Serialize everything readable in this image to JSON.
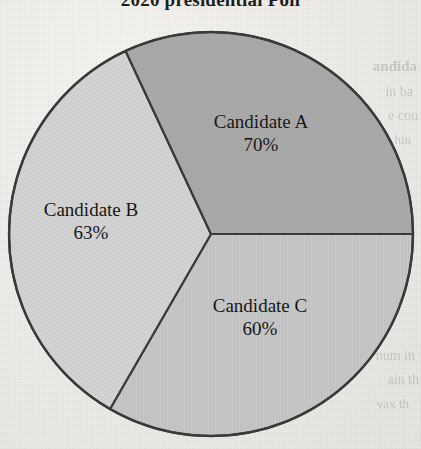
{
  "chart_data": {
    "type": "pie",
    "title": "2020 presidential Poll",
    "categories": [
      "Candidate A",
      "Candidate B",
      "Candidate C"
    ],
    "values": [
      70,
      63,
      60
    ],
    "value_unit": "%",
    "value_labels": [
      "70%",
      "63%",
      "60%"
    ],
    "slice_colors": [
      "#a9a9a9",
      "#d2d2d2",
      "#c6c6c6"
    ],
    "slice_angles_deg": [
      115,
      125,
      120
    ],
    "legend": "none",
    "grid": false,
    "xlabel": "",
    "ylabel": "",
    "note": "Percentages sum to 193%, exceeding 100%"
  },
  "chart": {
    "title": "2020 presidential Poll",
    "geometry": {
      "center_x": 211,
      "center_y": 234,
      "radius": 202,
      "outline_color": "#3a3a3a",
      "divider_color": "#3a3a3a"
    },
    "slices": [
      {
        "id": "a",
        "name": "Candidate A",
        "value_label": "70%",
        "value": 70,
        "color": "#a9a9a9",
        "start_deg": -115,
        "end_deg": 0
      },
      {
        "id": "b",
        "name": "Candidate B",
        "value_label": "63%",
        "value": 63,
        "color": "#d2d2d2",
        "start_deg": 120,
        "end_deg": 245
      },
      {
        "id": "c",
        "name": "Candidate C",
        "value_label": "60%",
        "value": 60,
        "color": "#c6c6c6",
        "start_deg": 0,
        "end_deg": 120
      }
    ]
  },
  "background": {
    "paper_color": "#f1f0ed",
    "showthrough": [
      "andida",
      "in ba",
      "e cou",
      "hin",
      "num in",
      "ain th",
      "vax th"
    ]
  }
}
